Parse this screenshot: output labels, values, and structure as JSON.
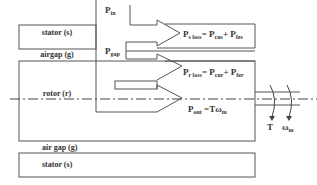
{
  "diagram": {
    "regions": {
      "stator_top": "stator (s)",
      "airgap_top": "airgap (g)",
      "rotor": "rotor (r)",
      "airgap_bottom": "air gap (g)",
      "stator_bottom": "stator (s)"
    },
    "powers": {
      "p_in": {
        "main": "P",
        "sub": "in"
      },
      "p_gap": {
        "main": "P",
        "sub": "gap"
      },
      "ps_loss": {
        "p": "P",
        "sub": "s loss",
        "eq": "= P",
        "sub2": "cus",
        "plus": "+ P",
        "sub3": "fes"
      },
      "pr_loss": {
        "p": "P",
        "sub": "r loss",
        "eq": "= P",
        "sub2": "cur",
        "plus": "+ P",
        "sub3": "fer"
      },
      "p_out": {
        "p": "P",
        "sub": "out",
        "eq": " =Tω",
        "sub2": "m"
      }
    },
    "shaft": {
      "torque": "T",
      "speed": "ω",
      "speed_sub": "m"
    },
    "colors": {
      "line": "#555555",
      "text": "#333333"
    }
  }
}
